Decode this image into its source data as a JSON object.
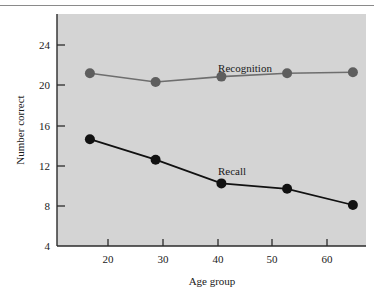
{
  "figure": {
    "background_color": "#ffffff",
    "plot_background_color": "#d4d4d4",
    "axis_color": "#2b2b2b",
    "top_rule_color": "#8a8a8a"
  },
  "chart_data": {
    "type": "line",
    "title": "",
    "xlabel": "Age group",
    "ylabel": "Number correct",
    "x": [
      20,
      30,
      40,
      50,
      60
    ],
    "xtick_labels": [
      "20",
      "30",
      "40",
      "50",
      "60"
    ],
    "ytick_labels": [
      "4",
      "8",
      "12",
      "16",
      "20",
      "24"
    ],
    "yticks": [
      4,
      8,
      12,
      16,
      20,
      24
    ],
    "xlim": [
      15,
      62
    ],
    "ylim": [
      4,
      25.5
    ],
    "grid": false,
    "legend_position": "inline-annotation",
    "series": [
      {
        "name": "Recognition",
        "values": [
          20.0,
          19.2,
          19.7,
          20.0,
          20.1
        ],
        "line_color": "#6e6e6e",
        "marker_color": "#5e5e5e",
        "marker_size": 5,
        "line_width": 1.6,
        "annotation": "Recognition"
      },
      {
        "name": "Recall",
        "values": [
          13.9,
          12.0,
          9.8,
          9.3,
          7.8
        ],
        "line_color": "#111111",
        "marker_color": "#111111",
        "marker_size": 5,
        "line_width": 1.8,
        "annotation": "Recall"
      }
    ],
    "annotations": [
      {
        "text": "Recognition",
        "x_px": 245,
        "y_px": 72
      },
      {
        "text": "Recall",
        "x_px": 232,
        "y_px": 175
      }
    ]
  }
}
